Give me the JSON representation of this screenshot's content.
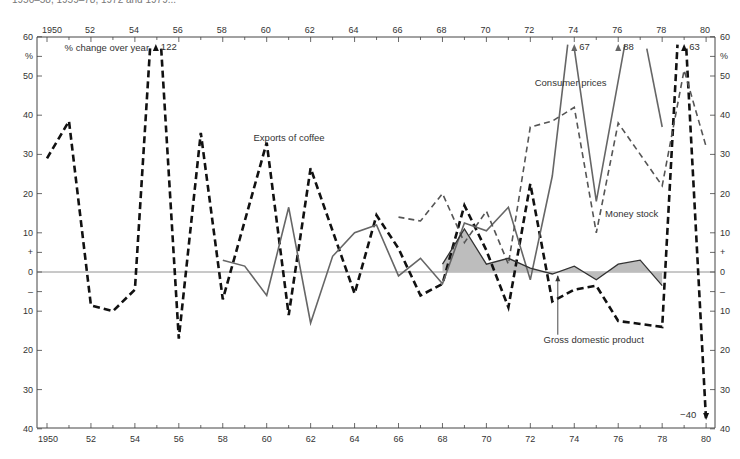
{
  "caption_fragment": "1950–58, 1959–78, 1972 and 1979...",
  "chart_data": {
    "type": "line",
    "title": "",
    "ylabel": "% change over year",
    "y_unit_label": "%",
    "xlabel": "",
    "x_range": [
      1950,
      1980
    ],
    "ylim": [
      -40,
      60
    ],
    "grid": false,
    "top_x_ticks": [
      "1950",
      "52",
      "54",
      "56",
      "58",
      "60",
      "62",
      "64",
      "66",
      "68",
      "70",
      "72",
      "74",
      "76",
      "78",
      "80"
    ],
    "bottom_x_ticks": [
      "1950",
      "52",
      "54",
      "56",
      "58",
      "60",
      "62",
      "64",
      "66",
      "68",
      "70",
      "72",
      "74",
      "76",
      "78",
      "80"
    ],
    "y_ticks_left": [
      {
        "v": 60,
        "label": "60"
      },
      {
        "v": 55,
        "label": "%"
      },
      {
        "v": 50,
        "label": "50"
      },
      {
        "v": 40,
        "label": "40"
      },
      {
        "v": 30,
        "label": "30"
      },
      {
        "v": 20,
        "label": "20"
      },
      {
        "v": 10,
        "label": "10"
      },
      {
        "v": 5,
        "label": "+"
      },
      {
        "v": 0,
        "label": "0"
      },
      {
        "v": -5,
        "label": "–"
      },
      {
        "v": -10,
        "label": "10"
      },
      {
        "v": -20,
        "label": "20"
      },
      {
        "v": -30,
        "label": "30"
      },
      {
        "v": -40,
        "label": "40"
      }
    ],
    "y_ticks_right": [
      {
        "v": 60,
        "label": "60"
      },
      {
        "v": 55,
        "label": "%"
      },
      {
        "v": 50,
        "label": "50"
      },
      {
        "v": 40,
        "label": "40"
      },
      {
        "v": 30,
        "label": "30"
      },
      {
        "v": 20,
        "label": "20"
      },
      {
        "v": 10,
        "label": "10"
      },
      {
        "v": 5,
        "label": "+"
      },
      {
        "v": 0,
        "label": "0"
      },
      {
        "v": -5,
        "label": "–"
      },
      {
        "v": -10,
        "label": "10"
      },
      {
        "v": -20,
        "label": "20"
      },
      {
        "v": -30,
        "label": "30"
      },
      {
        "v": -40,
        "label": "40"
      }
    ],
    "series": [
      {
        "name": "Exports of coffee",
        "style": "thick-dashed",
        "color": "#111111",
        "segments": [
          [
            [
              1950,
              29
            ],
            [
              1951,
              38.5
            ],
            [
              1952,
              -8.5
            ],
            [
              1953,
              -10
            ],
            [
              1954,
              -4.5
            ],
            [
              1954.7,
              58
            ]
          ],
          [
            [
              1955.2,
              57
            ],
            [
              1956,
              -17
            ],
            [
              1957,
              35.5
            ],
            [
              1958,
              -7
            ],
            [
              1960,
              33
            ],
            [
              1961,
              -11
            ],
            [
              1962,
              26.5
            ],
            [
              1964,
              -5.5
            ],
            [
              1965,
              14.5
            ],
            [
              1966,
              6
            ],
            [
              1967,
              -6
            ],
            [
              1968,
              -3
            ],
            [
              1969,
              17
            ],
            [
              1970,
              5.5
            ],
            [
              1971,
              -9
            ],
            [
              1972,
              22.5
            ],
            [
              1973,
              -7.5
            ],
            [
              1974,
              -4.5
            ],
            [
              1975,
              -3.5
            ],
            [
              1976,
              -12.5
            ],
            [
              1978,
              -14
            ],
            [
              1978.7,
              58
            ]
          ],
          [
            [
              1979.1,
              57
            ],
            [
              1980,
              -38
            ]
          ]
        ],
        "off_scale": [
          {
            "x": 1955,
            "value": 122,
            "label": "122"
          },
          {
            "x": 1979,
            "value": 63,
            "label": "63"
          },
          {
            "x": 1980,
            "value": -40,
            "label": "−40"
          }
        ]
      },
      {
        "name": "Consumer prices",
        "style": "solid",
        "color": "#666666",
        "segments": [
          [
            [
              1958,
              3
            ],
            [
              1959,
              1.5
            ],
            [
              1960,
              -6
            ],
            [
              1961,
              16.5
            ],
            [
              1962,
              -13
            ],
            [
              1963,
              4
            ],
            [
              1964,
              10
            ],
            [
              1965,
              12
            ],
            [
              1966,
              -1
            ],
            [
              1967,
              3.5
            ],
            [
              1968,
              -3
            ],
            [
              1969,
              12.5
            ],
            [
              1970,
              10.5
            ],
            [
              1971,
              16.5
            ],
            [
              1972,
              -2
            ],
            [
              1973,
              24.5
            ],
            [
              1973.7,
              58
            ]
          ],
          [
            [
              1974,
              57
            ],
            [
              1975,
              18
            ],
            [
              1976.3,
              58
            ]
          ],
          [
            [
              1977.3,
              57
            ],
            [
              1978,
              37
            ]
          ]
        ],
        "off_scale": [
          {
            "x": 1974,
            "value": 67,
            "label": "67"
          },
          {
            "x": 1976,
            "value": 88,
            "label": "88"
          }
        ]
      },
      {
        "name": "Money stock",
        "style": "thin-dashed",
        "color": "#555555",
        "segments": [
          [
            [
              1966,
              14
            ],
            [
              1967,
              13
            ],
            [
              1968,
              20
            ],
            [
              1969,
              7.5
            ],
            [
              1970,
              15.5
            ],
            [
              1971,
              2
            ],
            [
              1972,
              37
            ],
            [
              1973,
              38.5
            ],
            [
              1974,
              42
            ],
            [
              1975,
              10
            ],
            [
              1976,
              38
            ],
            [
              1978,
              22
            ],
            [
              1979,
              51.5
            ],
            [
              1980,
              32
            ]
          ]
        ]
      },
      {
        "name": "Gross domestic product",
        "style": "solid-shaded",
        "color": "#333333",
        "fill": "#bdbdbd",
        "segments": [
          [
            [
              1968,
              2
            ],
            [
              1969,
              11
            ],
            [
              1970,
              2
            ],
            [
              1971,
              3.5
            ],
            [
              1972,
              1
            ],
            [
              1973,
              -0.5
            ],
            [
              1974,
              1.5
            ],
            [
              1975,
              -2
            ],
            [
              1976,
              2
            ],
            [
              1977,
              3
            ],
            [
              1978,
              -3.5
            ]
          ]
        ]
      }
    ],
    "annotations": [
      {
        "text": "% change over year",
        "x": 1950.8,
        "y": 56.5
      },
      {
        "text": "Exports of coffee",
        "x": 1959.4,
        "y": 33.5
      },
      {
        "text": "Consumer prices",
        "x": 1972.2,
        "y": 47.5
      },
      {
        "text": "Money stock",
        "x": 1975.4,
        "y": 14
      },
      {
        "text": "Gross domestic product",
        "x": 1972.6,
        "y": -18
      }
    ]
  }
}
